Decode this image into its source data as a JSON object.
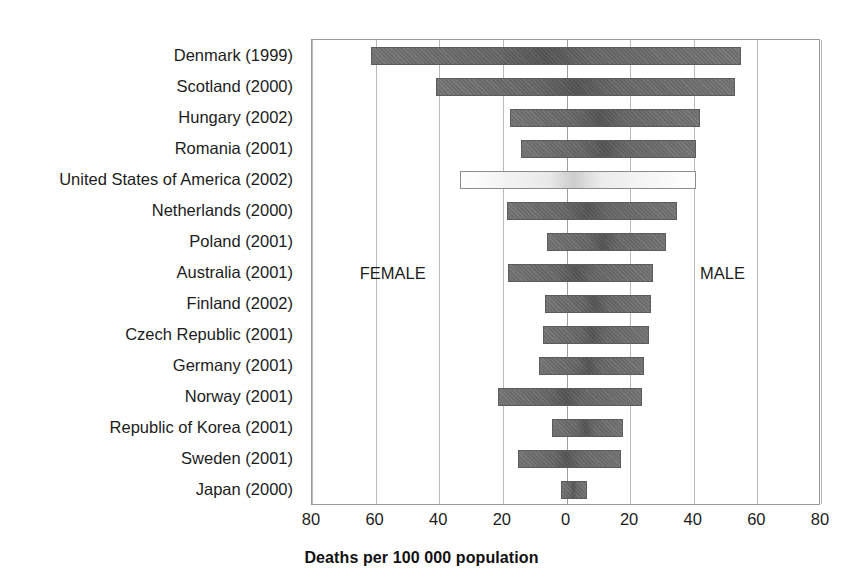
{
  "chart_data": {
    "type": "bar",
    "subtype": "diverging-horizontal",
    "title": "",
    "xlabel": "Deaths per 100 000 population",
    "ylabel": "",
    "grid": true,
    "legend_position": "in-plot",
    "axis": {
      "tick_labels": [
        "80",
        "60",
        "40",
        "20",
        "0",
        "20",
        "40",
        "60",
        "80"
      ],
      "tick_values": [
        -80,
        -60,
        -40,
        -20,
        0,
        20,
        40,
        60,
        80
      ],
      "xlim": [
        -80,
        80
      ],
      "left_side_label": "FEMALE",
      "right_side_label": "MALE"
    },
    "categories": [
      "Denmark (1999)",
      "Scotland (2000)",
      "Hungary (2002)",
      "Romania (2001)",
      "United States of America (2002)",
      "Netherlands (2000)",
      "Poland (2001)",
      "Australia (2001)",
      "Finland (2002)",
      "Czech Republic (2001)",
      "Germany (2001)",
      "Norway (2001)",
      "Republic of Korea (2001)",
      "Sweden (2001)",
      "Japan (2000)"
    ],
    "series": [
      {
        "name": "FEMALE",
        "side": "left",
        "values": [
          61.4,
          41.1,
          17.9,
          14.2,
          33.5,
          18.8,
          6.2,
          18.4,
          6.9,
          7.4,
          8.7,
          21.6,
          4.7,
          15.3,
          1.8
        ]
      },
      {
        "name": "MALE",
        "side": "right",
        "values": [
          54.8,
          52.9,
          41.9,
          40.8,
          40.8,
          34.6,
          31.2,
          27.2,
          26.6,
          25.8,
          24.5,
          23.7,
          17.9,
          17.2,
          6.3
        ]
      }
    ],
    "highlighted_category": "United States of America (2002)",
    "colors": {
      "bar_fill": "#6f6f6f",
      "bar_stroke": "#5c5c5c",
      "highlight_fill": "#ffffff",
      "highlight_stroke": "#8d8d8d",
      "gridline": "#b9b9b9",
      "frame": "#9a9a9a",
      "text": "#1c1c1c"
    }
  }
}
